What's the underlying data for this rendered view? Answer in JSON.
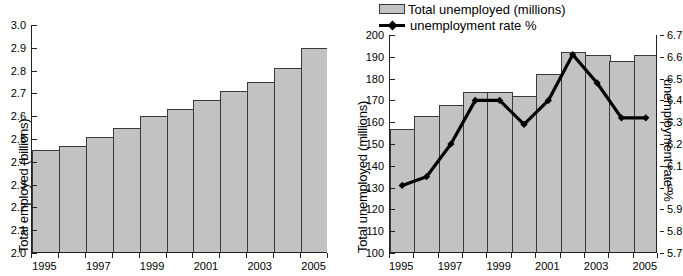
{
  "chart_data": [
    {
      "id": "employed",
      "type": "bar",
      "title": "",
      "xlabel": "",
      "ylabel": "Total employed (billions)",
      "categories": [
        1995,
        1996,
        1997,
        1998,
        1999,
        2000,
        2001,
        2002,
        2003,
        2004,
        2005
      ],
      "tick_labels_x": [
        "1995",
        "",
        "1997",
        "",
        "1999",
        "",
        "2001",
        "",
        "2003",
        "",
        "2005"
      ],
      "values": [
        2.45,
        2.47,
        2.51,
        2.55,
        2.6,
        2.63,
        2.67,
        2.71,
        2.75,
        2.81,
        2.9
      ],
      "ylim": [
        2.0,
        3.0
      ],
      "ytick_values": [
        2.0,
        2.1,
        2.2,
        2.3,
        2.4,
        2.5,
        2.6,
        2.7,
        2.8,
        2.9,
        3.0
      ],
      "ytick_labels": [
        "2.0",
        "2.1",
        "2.2",
        "2.3",
        "2.4",
        "2.5",
        "2.6",
        "2.7",
        "2.8",
        "2.9",
        "3.0"
      ],
      "grid": false,
      "legend": "none",
      "bar_color": "#c2c2c2",
      "bar_edge_color": "#3a3a3a"
    },
    {
      "id": "unemployed",
      "type": "bar+line",
      "title": "",
      "xlabel": "",
      "ylabel": "Total unemployed (millions)",
      "y2label": "unemployment rate %",
      "categories": [
        1995,
        1996,
        1997,
        1998,
        1999,
        2000,
        2001,
        2002,
        2003,
        2004,
        2005
      ],
      "tick_labels_x": [
        "1995",
        "",
        "1997",
        "",
        "1999",
        "",
        "2001",
        "",
        "2003",
        "",
        "2005"
      ],
      "ylim": [
        100,
        200
      ],
      "ytick_values": [
        100,
        110,
        120,
        130,
        140,
        150,
        160,
        170,
        180,
        190,
        200
      ],
      "ytick_labels": [
        "100",
        "110",
        "120",
        "130",
        "140",
        "150",
        "160",
        "170",
        "180",
        "190",
        "200"
      ],
      "y2lim": [
        5.7,
        6.7
      ],
      "y2tick_values": [
        5.7,
        5.8,
        5.9,
        6.0,
        6.1,
        6.2,
        6.3,
        6.4,
        6.5,
        6.6,
        6.7
      ],
      "y2tick_labels": [
        "5.7",
        "5.8",
        "5.9",
        "6",
        "6.1",
        "6.2",
        "6.3",
        "6.4",
        "6.5",
        "6.6",
        "6.7"
      ],
      "grid": false,
      "legend": "top",
      "bar_color": "#c2c2c2",
      "bar_edge_color": "#3a3a3a",
      "line_color": "#000000",
      "series": [
        {
          "name": "Total unemployed (millions)",
          "kind": "bar",
          "axis": "left",
          "values": [
            157,
            163,
            168,
            174,
            174,
            172,
            182,
            192,
            191,
            188,
            191
          ]
        },
        {
          "name": "unemployment rate %",
          "kind": "line",
          "axis": "right",
          "values": [
            6.01,
            6.05,
            6.2,
            6.4,
            6.4,
            6.29,
            6.4,
            6.61,
            6.48,
            6.32,
            6.32
          ]
        }
      ]
    }
  ],
  "legend": {
    "bar_label": "Total unemployed (millions)",
    "line_label": "unemployment rate %"
  }
}
